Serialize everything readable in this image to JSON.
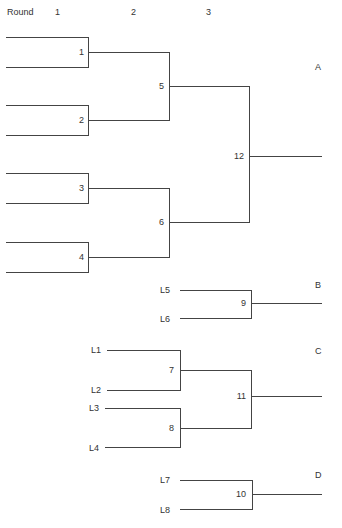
{
  "header": {
    "round_label": "Round",
    "rounds": [
      "1",
      "2",
      "3"
    ]
  },
  "brackets": {
    "A": {
      "label": "A",
      "matches": [
        "1",
        "2",
        "3",
        "4",
        "5",
        "6",
        "12"
      ]
    },
    "B": {
      "label": "B",
      "entrants": [
        "L5",
        "L6"
      ],
      "match": "9"
    },
    "C": {
      "label": "C",
      "entrants": [
        "L1",
        "L2",
        "L3",
        "L4"
      ],
      "matches": [
        "7",
        "8",
        "11"
      ]
    },
    "D": {
      "label": "D",
      "entrants": [
        "L7",
        "L8"
      ],
      "match": "10"
    }
  },
  "colors": {
    "line": "#444444",
    "text": "#333333",
    "background": "#ffffff"
  }
}
